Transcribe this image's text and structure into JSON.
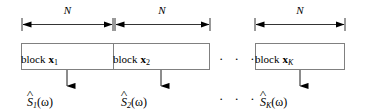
{
  "figure": {
    "stroke_color": "#000000",
    "box_border_color": "#808080",
    "background_color": "#ffffff"
  },
  "dimensions": [
    {
      "label": "N",
      "x": 22,
      "width": 91
    },
    {
      "label": "N",
      "x": 114,
      "width": 96
    },
    {
      "label": "N",
      "x": 255,
      "width": 90
    }
  ],
  "blocks": [
    {
      "text": "block",
      "vector": "x",
      "subscript": "1",
      "subscript_italic": false,
      "x": 21,
      "width": 92
    },
    {
      "text": "block",
      "vector": "x",
      "subscript": "2",
      "subscript_italic": false,
      "x": 113,
      "width": 97
    },
    {
      "text": "block",
      "vector": "x",
      "subscript": "K",
      "subscript_italic": true,
      "x": 255,
      "width": 90
    }
  ],
  "estimates": [
    {
      "hat": "^",
      "symbol": "S",
      "subscript": "1",
      "argument": "(ω)",
      "center_x": 67
    },
    {
      "hat": "^",
      "symbol": "S",
      "subscript": "2",
      "argument": "(ω)",
      "center_x": 161
    },
    {
      "hat": "^",
      "symbol": "S",
      "subscript": "K",
      "argument": "(ω)",
      "center_x": 300
    }
  ],
  "ellipses": [
    {
      "dots": "· · ·",
      "x": 219,
      "y": 51
    },
    {
      "dots": "· · ·",
      "x": 219,
      "y": 91
    }
  ]
}
